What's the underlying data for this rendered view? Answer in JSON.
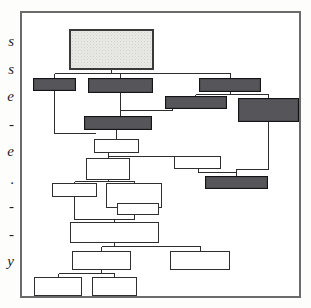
{
  "figure": {
    "kind": "flowchart",
    "frame": {
      "border_color": "#6b6b6b",
      "background": "#ffffff"
    },
    "palette": {
      "screen_fill": "#e9e9e6",
      "dark_fill": "#55555a",
      "white_fill": "#ffffff",
      "line_color": "#2d2d2d",
      "frame_color": "#6b6b6b",
      "text_color": "#1c1c1c"
    },
    "nodes": [
      {
        "id": "n1",
        "style": "screen",
        "x": 47,
        "y": 16,
        "w": 85,
        "h": 41,
        "label": ""
      },
      {
        "id": "n2",
        "style": "dark",
        "x": 11,
        "y": 65,
        "w": 43,
        "h": 13,
        "label": ""
      },
      {
        "id": "n3",
        "style": "dark",
        "x": 66,
        "y": 65,
        "w": 65,
        "h": 15,
        "label": ""
      },
      {
        "id": "n4",
        "style": "dark",
        "x": 177,
        "y": 65,
        "w": 62,
        "h": 14,
        "label": ""
      },
      {
        "id": "n5",
        "style": "dark",
        "x": 143,
        "y": 83,
        "w": 62,
        "h": 13,
        "label": ""
      },
      {
        "id": "n6",
        "style": "dark",
        "x": 216,
        "y": 85,
        "w": 61,
        "h": 24,
        "label": ""
      },
      {
        "id": "n7",
        "style": "dark",
        "x": 62,
        "y": 103,
        "w": 68,
        "h": 14,
        "label": ""
      },
      {
        "id": "n8",
        "style": "white",
        "x": 72,
        "y": 126,
        "w": 45,
        "h": 14,
        "label": ""
      },
      {
        "id": "n9",
        "style": "white",
        "x": 64,
        "y": 145,
        "w": 44,
        "h": 22,
        "label": ""
      },
      {
        "id": "n10",
        "style": "white",
        "x": 152,
        "y": 143,
        "w": 47,
        "h": 13,
        "label": ""
      },
      {
        "id": "n11",
        "style": "dark",
        "x": 183,
        "y": 163,
        "w": 63,
        "h": 13,
        "label": ""
      },
      {
        "id": "n12",
        "style": "white",
        "x": 30,
        "y": 170,
        "w": 45,
        "h": 14,
        "label": ""
      },
      {
        "id": "n13",
        "style": "white",
        "x": 84,
        "y": 170,
        "w": 56,
        "h": 25,
        "label": ""
      },
      {
        "id": "n14",
        "style": "white",
        "x": 95,
        "y": 190,
        "w": 42,
        "h": 12,
        "label": ""
      },
      {
        "id": "n15",
        "style": "white",
        "x": 48,
        "y": 209,
        "w": 89,
        "h": 21,
        "label": ""
      },
      {
        "id": "n16",
        "style": "white",
        "x": 50,
        "y": 238,
        "w": 59,
        "h": 19,
        "label": ""
      },
      {
        "id": "n17",
        "style": "white",
        "x": 148,
        "y": 238,
        "w": 60,
        "h": 19,
        "label": ""
      },
      {
        "id": "n18",
        "style": "white",
        "x": 12,
        "y": 264,
        "w": 48,
        "h": 19,
        "label": ""
      },
      {
        "id": "n19",
        "style": "white",
        "x": 70,
        "y": 264,
        "w": 45,
        "h": 19,
        "label": ""
      }
    ],
    "connectors": [
      "n1-bus-down-to-n2-n3-n4",
      "n2-down-to-left-rail-n9",
      "n3-down-to-n7",
      "n4-down-to-n5",
      "n4-down-to-n6",
      "n5-right-to-n7-bus",
      "n6-down-to-n11",
      "n7-down-to-n8",
      "n8-down-to-n9",
      "n8-right-to-n10",
      "n10-down-to-n11",
      "n9-down-bus-to-n12-n13",
      "n13-down-to-n14",
      "n12-down-to-n15",
      "n14-down-to-n15",
      "n15-down-bus-to-n16-n17",
      "n16-down-bus-to-n18-n19"
    ]
  },
  "margin_text": {
    "note": "Cut-off right edge of an adjacent text column; only partial serif letterforms are visible",
    "glyphs": [
      "s",
      "s",
      "e",
      "-",
      "e",
      ".",
      "-",
      "-",
      "y"
    ]
  }
}
